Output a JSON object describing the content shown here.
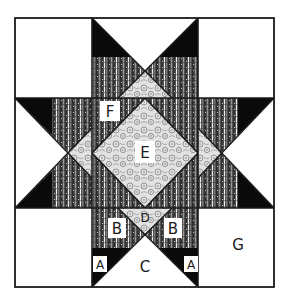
{
  "diagram": {
    "type": "quilt-block-piecing-diagram",
    "colors": {
      "background": "#ffffff",
      "outline": "#1a1a1a",
      "black_fabric": "#0a0a0a",
      "stripe_dark": "#4a4a4a",
      "stripe_light": "#e8e8e8",
      "paisley_base": "#d8d8d8",
      "label_box": "#ffffff"
    },
    "labels": {
      "A_left": "A",
      "A_right": "A",
      "B_left": "B",
      "B_right": "B",
      "C": "C",
      "D": "D",
      "E": "E",
      "F": "F",
      "G": "G"
    },
    "pieces": [
      {
        "id": "A",
        "description": "black corner triangle",
        "fabric": "solid black"
      },
      {
        "id": "B",
        "description": "striped triangle",
        "fabric": "dark stripe"
      },
      {
        "id": "C",
        "description": "large white triangle",
        "fabric": "white"
      },
      {
        "id": "D",
        "description": "small center-edge triangle",
        "fabric": "light paisley"
      },
      {
        "id": "E",
        "description": "center square on point",
        "fabric": "light paisley"
      },
      {
        "id": "F",
        "description": "center corner triangles",
        "fabric": "dark stripe"
      },
      {
        "id": "G",
        "description": "corner square",
        "fabric": "white"
      }
    ]
  }
}
